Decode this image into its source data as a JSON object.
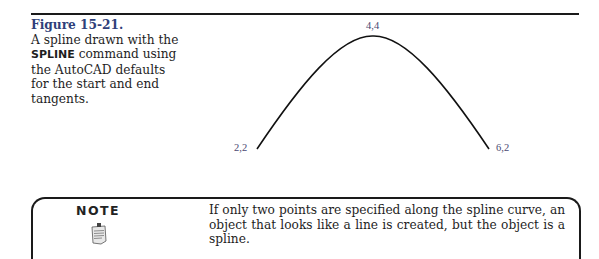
{
  "figure": {
    "label": "Figure 15-21.",
    "caption_pre": "A spline drawn with the ",
    "caption_cmd": "SPLINE",
    "caption_post": " command using the AutoCAD defaults for the start and end tangents.",
    "points": [
      {
        "label": "2,2",
        "x": 2,
        "y": 2
      },
      {
        "label": "4,4",
        "x": 4,
        "y": 4
      },
      {
        "label": "6,2",
        "x": 6,
        "y": 2
      }
    ]
  },
  "note": {
    "title": "NOTE",
    "icon": "notepad-icon",
    "text": "If only two points are specified along the spline curve, an object that looks like a line is created, but the object is a spline."
  }
}
